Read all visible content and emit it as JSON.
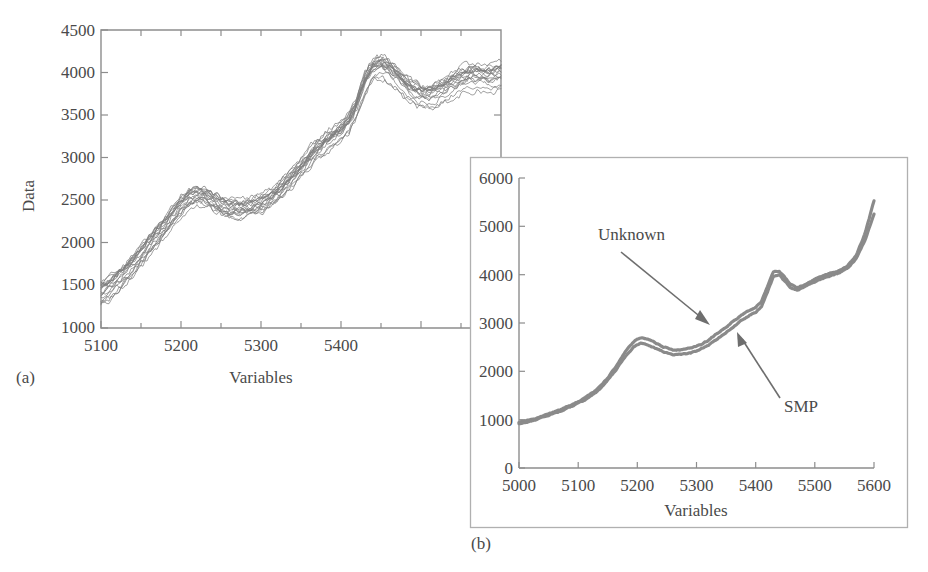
{
  "figure": {
    "background_color": "#ffffff",
    "curve_color": "#7d7d7d",
    "inset_curve_color": "#8a8a8a",
    "axis_color": "#8d8d8d",
    "text_color": "#4a4a4a"
  },
  "panel_a": {
    "label": "(a)",
    "xlabel": "Variables",
    "ylabel": "Data"
  },
  "panel_b": {
    "label": "(b)",
    "xlabel": "Variables",
    "ylabel": "",
    "annotations": [
      {
        "text": "Unknown"
      },
      {
        "text": "SMP"
      }
    ]
  },
  "chart_data": [
    {
      "id": "panel-a",
      "type": "line",
      "title": "",
      "subtitle": "",
      "xlabel": "Variables",
      "ylabel": "Data",
      "panel_label": "(a)",
      "xlim": [
        5090,
        5590
      ],
      "ylim": [
        1000,
        4500
      ],
      "xticks": [
        5100,
        5200,
        5300,
        5400
      ],
      "xtick_labels": [
        "5100",
        "5200",
        "5300",
        "5400"
      ],
      "xminor_ticks": [
        5150,
        5250,
        5350,
        5450,
        5500,
        5550
      ],
      "yticks": [
        1000,
        1500,
        2000,
        2500,
        3000,
        3500,
        4000,
        4500
      ],
      "ytick_labels": [
        "1000",
        "1500",
        "2000",
        "2500",
        "3000",
        "3500",
        "4000",
        "4500"
      ],
      "grid": false,
      "legend": "none",
      "n_series": 18,
      "series_description": "Overlaid raw NIR spectra of multiple samples (noisy, un-preprocessed)",
      "x": [
        5090,
        5100,
        5110,
        5120,
        5130,
        5140,
        5150,
        5160,
        5170,
        5180,
        5190,
        5200,
        5210,
        5220,
        5230,
        5240,
        5250,
        5260,
        5270,
        5280,
        5290,
        5300,
        5310,
        5320,
        5330,
        5340,
        5350,
        5360,
        5370,
        5380,
        5390,
        5400,
        5410,
        5420,
        5430,
        5440,
        5450,
        5460,
        5470,
        5480,
        5490,
        5500,
        5510,
        5520,
        5530,
        5540,
        5550,
        5560,
        5570,
        5580,
        5590
      ],
      "mean_values": [
        1430,
        1490,
        1570,
        1660,
        1760,
        1870,
        1980,
        2090,
        2210,
        2330,
        2440,
        2530,
        2560,
        2540,
        2490,
        2440,
        2400,
        2390,
        2400,
        2420,
        2450,
        2500,
        2570,
        2660,
        2760,
        2870,
        2980,
        3080,
        3160,
        3230,
        3300,
        3400,
        3600,
        3870,
        4030,
        4060,
        4010,
        3920,
        3830,
        3760,
        3720,
        3710,
        3740,
        3790,
        3850,
        3900,
        3930,
        3940,
        3930,
        3930,
        3950
      ],
      "spread_half_width": 140
    },
    {
      "id": "panel-b",
      "type": "line",
      "title": "",
      "subtitle": "",
      "xlabel": "Variables",
      "ylabel": "",
      "panel_label": "(b)",
      "xlim": [
        5000,
        5600
      ],
      "ylim": [
        0,
        6000
      ],
      "xticks": [
        5000,
        5100,
        5200,
        5300,
        5400,
        5500,
        5600
      ],
      "xtick_labels": [
        "5000",
        "5100",
        "5200",
        "5300",
        "5400",
        "5500",
        "5600"
      ],
      "yticks": [
        0,
        1000,
        2000,
        3000,
        4000,
        5000,
        6000
      ],
      "ytick_labels": [
        "0",
        "1000",
        "2000",
        "3000",
        "4000",
        "5000",
        "6000"
      ],
      "grid": false,
      "legend": "annotations",
      "x": [
        5000,
        5015,
        5030,
        5045,
        5060,
        5075,
        5090,
        5105,
        5120,
        5135,
        5150,
        5165,
        5180,
        5195,
        5205,
        5215,
        5230,
        5245,
        5260,
        5275,
        5290,
        5305,
        5320,
        5335,
        5350,
        5365,
        5380,
        5392,
        5400,
        5410,
        5420,
        5430,
        5440,
        5450,
        5460,
        5470,
        5480,
        5495,
        5510,
        5525,
        5540,
        5555,
        5570,
        5585,
        5600
      ],
      "series": [
        {
          "name": "Unknown",
          "values": [
            950,
            990,
            1040,
            1100,
            1160,
            1230,
            1310,
            1400,
            1510,
            1660,
            1870,
            2120,
            2400,
            2620,
            2700,
            2680,
            2590,
            2500,
            2450,
            2450,
            2480,
            2540,
            2640,
            2780,
            2920,
            3060,
            3200,
            3290,
            3330,
            3450,
            3760,
            4060,
            4080,
            3930,
            3790,
            3740,
            3780,
            3880,
            3960,
            4020,
            4080,
            4180,
            4400,
            4850,
            5530
          ]
        },
        {
          "name": "SMP",
          "values": [
            920,
            960,
            1010,
            1070,
            1130,
            1200,
            1280,
            1370,
            1480,
            1620,
            1820,
            2050,
            2320,
            2520,
            2580,
            2560,
            2480,
            2400,
            2350,
            2350,
            2380,
            2440,
            2540,
            2670,
            2810,
            2950,
            3090,
            3180,
            3220,
            3340,
            3650,
            3960,
            3990,
            3850,
            3720,
            3680,
            3730,
            3830,
            3910,
            3970,
            4030,
            4130,
            4340,
            4720,
            5250
          ]
        }
      ]
    }
  ]
}
